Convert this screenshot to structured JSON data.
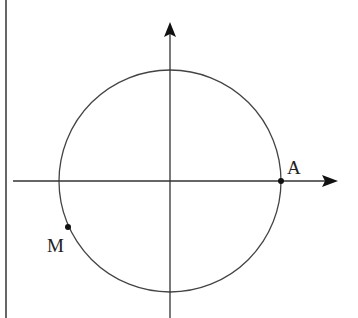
{
  "diagram": {
    "type": "unit-circle",
    "colors": {
      "stroke": "#333333",
      "background": "#ffffff"
    },
    "points": [
      {
        "label": "A",
        "position": "intersection of circle with positive x-axis"
      },
      {
        "label": "M",
        "position": "on circle, third quadrant, lower left"
      }
    ]
  }
}
